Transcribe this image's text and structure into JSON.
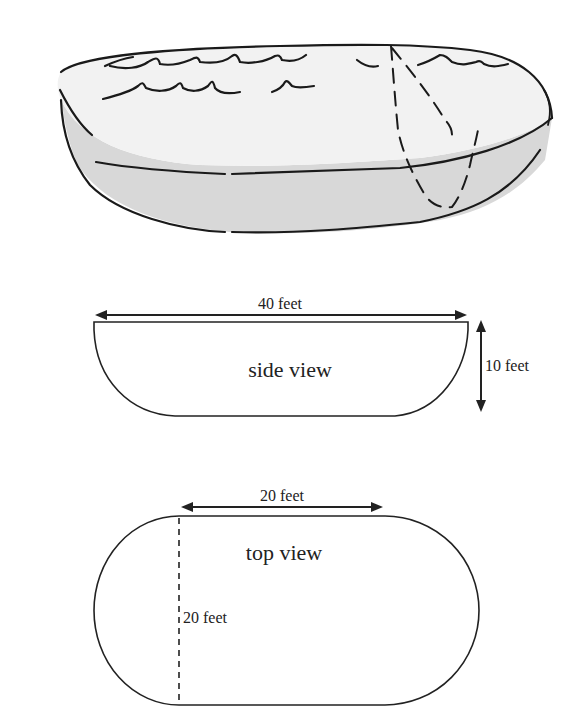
{
  "figure": {
    "pool_sketch": {
      "description": "hand-drawn pool with water ripples and dashed cross-section",
      "colors": {
        "outline": "#1a1a1a",
        "water_surface": "#f2f2f2",
        "side_wall": "#d8d8d8"
      }
    },
    "side_view": {
      "label": "side view",
      "width_label": "40 feet",
      "depth_label": "10 feet"
    },
    "top_view": {
      "label": "top view",
      "straight_length_label": "20 feet",
      "diameter_label": "20 feet"
    }
  }
}
